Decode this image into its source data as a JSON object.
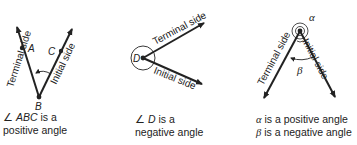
{
  "panels": [
    {
      "id": "positive-angle-ABC",
      "labels": {
        "terminal": "Terminal side",
        "initial": "Initial side",
        "point_a": "A",
        "point_b": "B",
        "point_c": "C"
      },
      "caption": {
        "symbol": "∠",
        "name": "ABC",
        "line1_rest": " is a",
        "line2": "positive angle"
      }
    },
    {
      "id": "negative-angle-D",
      "labels": {
        "terminal": "Terminal side",
        "initial": "Initial side",
        "vertex": "D"
      },
      "caption": {
        "symbol": "∠",
        "name": "D",
        "line1_rest": " is a",
        "line2": "negative angle"
      }
    },
    {
      "id": "alpha-beta-angles",
      "labels": {
        "terminal": "Terminal side",
        "initial": "Initial side",
        "alpha": "α",
        "beta": "β"
      },
      "caption": {
        "line1_symbol": "α",
        "line1_rest": " is a positive angle",
        "line2_symbol": "β",
        "line2_rest": " is a negative angle"
      }
    }
  ],
  "colors": {
    "ink": "#222222",
    "background": "#ffffff"
  }
}
